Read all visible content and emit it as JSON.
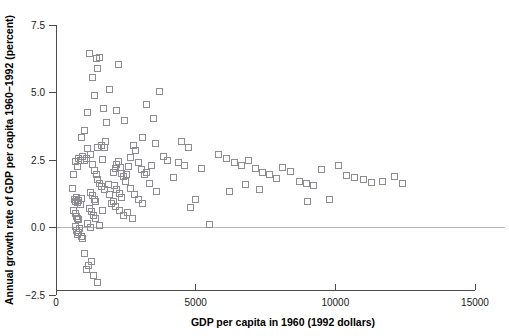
{
  "chart_data": {
    "type": "scatter",
    "title": "",
    "xlabel": "GDP per capita in 1960 (1992 dollars)",
    "ylabel": "Annual growth rate of GDP per capita 1960−1992 (percent)",
    "xlim": [
      0,
      15000
    ],
    "ylim": [
      -2.5,
      7.5
    ],
    "xticks": [
      0,
      5000,
      10000,
      15000
    ],
    "xtick_labels": [
      "0",
      "5000",
      "10000",
      "15000"
    ],
    "yticks": [
      -2.5,
      0.0,
      2.5,
      5.0,
      7.5
    ],
    "ytick_labels": [
      "−2.5",
      "0.0",
      "2.5",
      "5.0",
      "7.5"
    ],
    "grid": false,
    "legend": null,
    "marker": "open-square",
    "marker_color": "#8c8c92",
    "marker_size": 6,
    "reference_lines": [
      {
        "orientation": "horizontal",
        "value": 0.0,
        "color": "#b4b4b4"
      }
    ],
    "series": [
      {
        "name": "Countries",
        "points": [
          [
            700,
            2.45
          ],
          [
            760,
            2.25
          ],
          [
            820,
            2.55
          ],
          [
            880,
            2.5
          ],
          [
            950,
            2.62
          ],
          [
            1020,
            2.48
          ],
          [
            1080,
            2.55
          ],
          [
            640,
            1.95
          ],
          [
            600,
            1.45
          ],
          [
            660,
            1.05
          ],
          [
            700,
            0.98
          ],
          [
            740,
            1.12
          ],
          [
            780,
            0.92
          ],
          [
            820,
            1.02
          ],
          [
            860,
            0.86
          ],
          [
            900,
            1.08
          ],
          [
            620,
            0.62
          ],
          [
            680,
            0.52
          ],
          [
            720,
            0.42
          ],
          [
            760,
            0.35
          ],
          [
            800,
            0.28
          ],
          [
            690,
            0.05
          ],
          [
            730,
            -0.12
          ],
          [
            770,
            -0.25
          ],
          [
            810,
            -0.18
          ],
          [
            850,
            -0.05
          ],
          [
            900,
            -0.35
          ],
          [
            960,
            -0.42
          ],
          [
            1010,
            -0.95
          ],
          [
            1080,
            -1.55
          ],
          [
            1150,
            -1.42
          ],
          [
            1350,
            -1.78
          ],
          [
            1480,
            -2.05
          ],
          [
            1280,
            -1.25
          ],
          [
            900,
            3.35
          ],
          [
            1030,
            3.6
          ],
          [
            1120,
            4.25
          ],
          [
            1180,
            6.45
          ],
          [
            1320,
            5.55
          ],
          [
            1450,
            6.25
          ],
          [
            1380,
            4.9
          ],
          [
            1500,
            5.9
          ],
          [
            1560,
            6.3
          ],
          [
            1700,
            4.4
          ],
          [
            1820,
            3.9
          ],
          [
            1640,
            3.05
          ],
          [
            1720,
            2.95
          ],
          [
            1780,
            3.2
          ],
          [
            1120,
            2.92
          ],
          [
            1240,
            2.7
          ],
          [
            1300,
            2.35
          ],
          [
            1380,
            2.1
          ],
          [
            1440,
            1.95
          ],
          [
            1500,
            1.78
          ],
          [
            1560,
            1.62
          ],
          [
            1620,
            1.52
          ],
          [
            1240,
            1.3
          ],
          [
            1300,
            1.18
          ],
          [
            1360,
            1.05
          ],
          [
            1420,
            0.95
          ],
          [
            1180,
            0.72
          ],
          [
            1260,
            0.58
          ],
          [
            1340,
            0.45
          ],
          [
            1420,
            0.32
          ],
          [
            1120,
            0.15
          ],
          [
            1220,
            0.02
          ],
          [
            1560,
            0.08
          ],
          [
            1680,
            0.62
          ],
          [
            1740,
            1.42
          ],
          [
            1860,
            1.58
          ],
          [
            1920,
            1.22
          ],
          [
            1980,
            0.88
          ],
          [
            2050,
            2.05
          ],
          [
            2120,
            2.18
          ],
          [
            2180,
            2.32
          ],
          [
            2240,
            2.45
          ],
          [
            2300,
            2.22
          ],
          [
            2360,
            2.02
          ],
          [
            2420,
            1.88
          ],
          [
            2480,
            1.72
          ],
          [
            2100,
            1.55
          ],
          [
            2180,
            1.4
          ],
          [
            2260,
            1.25
          ],
          [
            2340,
            1.12
          ],
          [
            2040,
            0.95
          ],
          [
            2140,
            0.78
          ],
          [
            2260,
            0.62
          ],
          [
            2400,
            0.45
          ],
          [
            2520,
            1.95
          ],
          [
            2600,
            2.25
          ],
          [
            2680,
            2.6
          ],
          [
            2760,
            3.05
          ],
          [
            2850,
            2.85
          ],
          [
            2950,
            2.4
          ],
          [
            3050,
            2.15
          ],
          [
            3150,
            1.95
          ],
          [
            2650,
            1.45
          ],
          [
            2800,
            1.22
          ],
          [
            2950,
            1.05
          ],
          [
            3100,
            0.88
          ],
          [
            2550,
            0.55
          ],
          [
            2750,
            0.32
          ],
          [
            3250,
            2.05
          ],
          [
            3400,
            2.3
          ],
          [
            3550,
            3.1
          ],
          [
            3700,
            5.05
          ],
          [
            3480,
            4.05
          ],
          [
            3250,
            4.55
          ],
          [
            3100,
            3.35
          ],
          [
            3350,
            1.62
          ],
          [
            3600,
            1.35
          ],
          [
            3850,
            2.62
          ],
          [
            4000,
            2.5
          ],
          [
            4200,
            1.85
          ],
          [
            4400,
            2.42
          ],
          [
            4600,
            2.3
          ],
          [
            4800,
            0.75
          ],
          [
            5000,
            1.05
          ],
          [
            5500,
            0.12
          ],
          [
            5800,
            2.7
          ],
          [
            6100,
            2.55
          ],
          [
            6400,
            2.42
          ],
          [
            6650,
            2.28
          ],
          [
            6900,
            2.5
          ],
          [
            7150,
            2.2
          ],
          [
            7400,
            2.05
          ],
          [
            7650,
            1.95
          ],
          [
            7900,
            1.82
          ],
          [
            6200,
            1.35
          ],
          [
            6800,
            1.58
          ],
          [
            7300,
            1.42
          ],
          [
            8100,
            2.22
          ],
          [
            8400,
            2.08
          ],
          [
            8700,
            1.72
          ],
          [
            8950,
            1.62
          ],
          [
            9200,
            1.55
          ],
          [
            9500,
            2.15
          ],
          [
            9800,
            1.05
          ],
          [
            10100,
            2.3
          ],
          [
            10400,
            1.92
          ],
          [
            10700,
            1.85
          ],
          [
            11000,
            1.78
          ],
          [
            11300,
            1.68
          ],
          [
            11700,
            1.72
          ],
          [
            12100,
            1.88
          ],
          [
            12400,
            1.62
          ],
          [
            9000,
            0.95
          ],
          [
            5200,
            2.18
          ],
          [
            4500,
            3.18
          ],
          [
            4750,
            2.95
          ],
          [
            2450,
            3.95
          ],
          [
            2150,
            4.35
          ],
          [
            1900,
            5.1
          ],
          [
            2250,
            6.05
          ],
          [
            1650,
            2.52
          ],
          [
            1480,
            2.95
          ]
        ]
      }
    ]
  },
  "axes": {
    "x_axis_name": "x-axis",
    "y_axis_name": "y-axis"
  }
}
